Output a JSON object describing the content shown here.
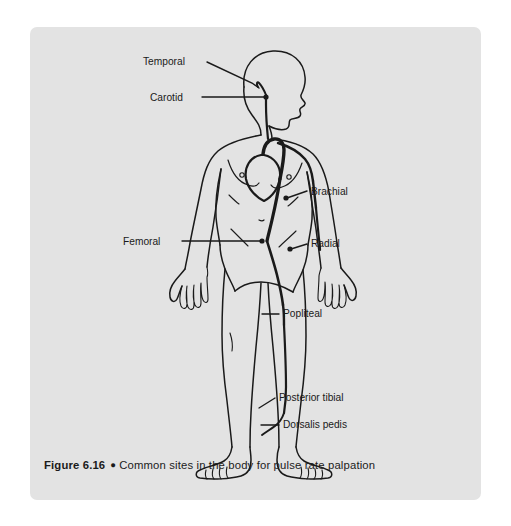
{
  "figure": {
    "caption_number": "Figure 6.16",
    "caption_bullet": "●",
    "caption_text": "Common sites in the body for pulse rate palpation",
    "background_color": "#e3e3e3",
    "page_color": "#ffffff",
    "line_color": "#1a1a1a",
    "artery_color": "#1a1a1a",
    "labels": [
      {
        "id": "temporal",
        "text": "Temporal",
        "text_x": 113,
        "text_y": 38,
        "anchor": "start",
        "leader": "M 177 35 L 222 56 L 229 61",
        "dot": null
      },
      {
        "id": "carotid",
        "text": "Carotid",
        "text_x": 120,
        "text_y": 74,
        "anchor": "start",
        "leader": "M 172 70 L 236 70",
        "dot": {
          "x": 236,
          "y": 70
        }
      },
      {
        "id": "brachial",
        "text": "Brachial",
        "text_x": 281,
        "text_y": 168,
        "anchor": "start",
        "leader": "M 277 164 L 257 171",
        "dot": {
          "x": 256,
          "y": 171
        }
      },
      {
        "id": "radial",
        "text": "Radial",
        "text_x": 281,
        "text_y": 220,
        "anchor": "start",
        "leader": "M 277 217 L 261 222",
        "dot": {
          "x": 260,
          "y": 222
        }
      },
      {
        "id": "femoral",
        "text": "Femoral",
        "text_x": 93,
        "text_y": 218,
        "anchor": "start",
        "leader": "M 152 214 L 232 214",
        "dot": {
          "x": 232,
          "y": 214
        }
      },
      {
        "id": "popliteal",
        "text": "Popliteal",
        "text_x": 253,
        "text_y": 290,
        "anchor": "start",
        "leader": "M 249 287 L 232 287",
        "dot": null
      },
      {
        "id": "posterior-tibial",
        "text": "Posterior tibial",
        "text_x": 249,
        "text_y": 374,
        "anchor": "start",
        "leader": "M 245 371 L 229 381",
        "dot": null
      },
      {
        "id": "dorsalis-pedis",
        "text": "Dorsalis pedis",
        "text_x": 253,
        "text_y": 401,
        "anchor": "start",
        "leader": "M 249 398 L 231 398",
        "dot": null
      }
    ]
  }
}
